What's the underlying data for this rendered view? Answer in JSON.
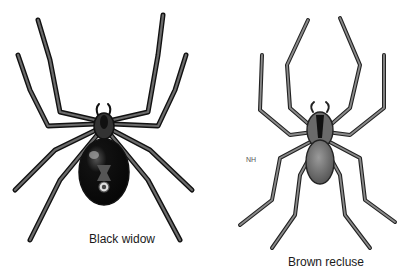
{
  "figure": {
    "spiders": [
      {
        "name": "black-widow",
        "caption": "Black widow"
      },
      {
        "name": "brown-recluse",
        "caption": "Brown recluse"
      }
    ],
    "artist_initials": "NH"
  },
  "colors": {
    "background": "#ffffff",
    "ink": "#111111",
    "leg_fill": "#6b6b6b",
    "widow_abdomen": "#0d0d0d",
    "recluse_abdomen": "#7a7a7a"
  }
}
